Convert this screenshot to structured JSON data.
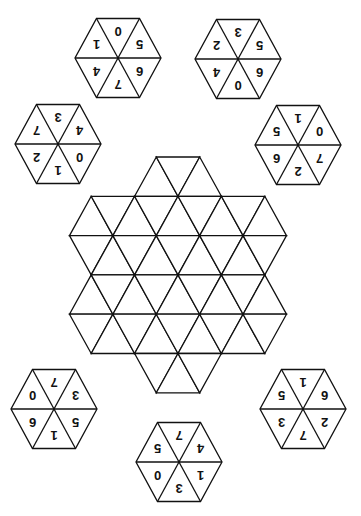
{
  "puzzle": {
    "board": {
      "shape": "hexagram",
      "rows_of_triangles": [
        3,
        9,
        9,
        9,
        9,
        3
      ],
      "total_triangles": 42
    },
    "sector_order": [
      "top",
      "upper-right",
      "lower-right",
      "bottom",
      "lower-left",
      "upper-left"
    ],
    "digits_rotated_180": true,
    "tiles": [
      {
        "id": "tile-top-left",
        "values": [
          "0",
          "5",
          "6",
          "7",
          "4",
          "1"
        ]
      },
      {
        "id": "tile-top-right",
        "values": [
          "3",
          "5",
          "6",
          "0",
          "4",
          "2"
        ]
      },
      {
        "id": "tile-left",
        "values": [
          "3",
          "4",
          "0",
          "1",
          "2",
          "7"
        ]
      },
      {
        "id": "tile-right",
        "values": [
          "1",
          "0",
          "7",
          "2",
          "6",
          "5"
        ]
      },
      {
        "id": "tile-bottom-left",
        "values": [
          "7",
          "3",
          "5",
          "1",
          "6",
          "0"
        ]
      },
      {
        "id": "tile-bottom-right",
        "values": [
          "1",
          "6",
          "2",
          "7",
          "3",
          "5"
        ]
      },
      {
        "id": "tile-bottom",
        "values": [
          "7",
          "4",
          "1",
          "3",
          "0",
          "5"
        ]
      }
    ],
    "colors": {
      "line": "#111111",
      "background": "#ffffff",
      "text": "#111111"
    }
  }
}
